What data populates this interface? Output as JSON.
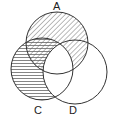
{
  "diagram": {
    "type": "venn",
    "sets": [
      {
        "label": "A",
        "cx": 57,
        "cy": 43,
        "r": 31
      },
      {
        "label": "C",
        "cx": 42,
        "cy": 69,
        "r": 31
      },
      {
        "label": "D",
        "cx": 75,
        "cy": 72,
        "r": 32
      }
    ],
    "shading": [
      {
        "region": "A only",
        "pattern": "diagonal"
      },
      {
        "region": "A and D not C",
        "pattern": "diagonal"
      },
      {
        "region": "A and C not D",
        "pattern": "diagonal+horizontal"
      },
      {
        "region": "C only",
        "pattern": "horizontal"
      },
      {
        "region": "A and C and D",
        "pattern": "none"
      },
      {
        "region": "C and D not A",
        "pattern": "none"
      },
      {
        "region": "D only",
        "pattern": "none"
      }
    ],
    "labels": {
      "a": "A",
      "c": "C",
      "d": "D"
    },
    "stroke_color": "#333333"
  }
}
